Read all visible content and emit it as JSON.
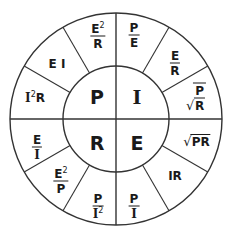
{
  "colors": {
    "line": "#333333",
    "text": "#1a1a1a",
    "background": "#ffffff"
  },
  "quadrants": [
    {
      "id": "P",
      "letter": "P",
      "meaning": "Power",
      "formulas": [
        {
          "type": "frac",
          "num": "E",
          "num_sup": "2",
          "den": "R"
        },
        {
          "type": "product",
          "text": "E I"
        },
        {
          "type": "power-product",
          "base": "I",
          "sup": "2",
          "rest": "R"
        }
      ]
    },
    {
      "id": "I",
      "letter": "I",
      "meaning": "Current",
      "formulas": [
        {
          "type": "frac",
          "num": "P",
          "den": "E"
        },
        {
          "type": "frac",
          "num": "E",
          "den": "R"
        },
        {
          "type": "sqrt-frac",
          "num": "P",
          "den": "R"
        }
      ]
    },
    {
      "id": "R",
      "letter": "R",
      "meaning": "Resistance",
      "formulas": [
        {
          "type": "frac",
          "num": "E",
          "den": "I"
        },
        {
          "type": "frac",
          "num": "E",
          "num_sup": "2",
          "den": "P"
        },
        {
          "type": "frac",
          "num": "P",
          "den": "I",
          "den_sup": "2"
        }
      ]
    },
    {
      "id": "E",
      "letter": "E",
      "meaning": "Voltage",
      "formulas": [
        {
          "type": "sqrt",
          "text": "PR"
        },
        {
          "type": "product",
          "text": "IR"
        },
        {
          "type": "frac",
          "num": "P",
          "den": "I"
        }
      ]
    }
  ],
  "labels": {
    "p_letter": "P",
    "i_letter": "I",
    "r_letter": "R",
    "e_letter": "E",
    "p_f1_num": "E",
    "p_f1_sup": "2",
    "p_f1_den": "R",
    "p_f2": "E I",
    "p_f3_base": "I",
    "p_f3_sup": "2",
    "p_f3_rest": "R",
    "i_f1_num": "P",
    "i_f1_den": "E",
    "i_f2_num": "E",
    "i_f2_den": "R",
    "i_f3_num": "P",
    "i_f3_den": "R",
    "r_f1_num": "E",
    "r_f1_den": "I",
    "r_f2_num": "E",
    "r_f2_sup": "2",
    "r_f2_den": "P",
    "r_f3_num": "P",
    "r_f3_den": "I",
    "r_f3_sup": "2",
    "e_f1": "PR",
    "e_f2": "IR",
    "e_f3_num": "P",
    "e_f3_den": "I",
    "sqrt_symbol": "√"
  }
}
